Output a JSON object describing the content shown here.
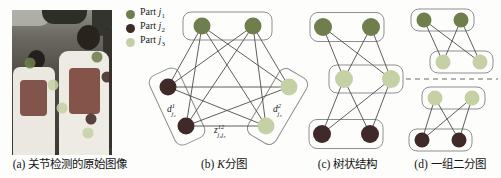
{
  "page": {
    "background": "#fdfdfc"
  },
  "parts": {
    "j1": "#6e7e4c",
    "j2": "#402a27",
    "j3": "#c6d0a5"
  },
  "style": {
    "edge_color": "#4d4d4d",
    "box_stroke": "#8f8f8f",
    "box_fill": "#fdfdfc",
    "divider_color": "#9a9a9a"
  },
  "legend": {
    "items": [
      {
        "prefix": "Part ",
        "symbol": "j",
        "subscript": "1",
        "part": "j1"
      },
      {
        "prefix": "Part ",
        "symbol": "j",
        "subscript": "2",
        "part": "j2"
      },
      {
        "prefix": "Part ",
        "symbol": "j",
        "subscript": "3",
        "part": "j3"
      }
    ]
  },
  "panels": {
    "a": {
      "caption": "(a) 关节检测的原始图像"
    },
    "b": {
      "caption_prefix": "(b) ",
      "caption_var": "K",
      "caption_suffix": "分图"
    },
    "c": {
      "caption": "(c) 树状结构"
    },
    "d": {
      "caption": "(d) 一组二分图"
    }
  },
  "photo": {
    "joints": [
      {
        "x": 18,
        "y": 53,
        "part": "j1"
      },
      {
        "x": 85,
        "y": 47,
        "part": "j1"
      },
      {
        "x": 95,
        "y": 67,
        "part": "j2"
      },
      {
        "x": 41,
        "y": 75,
        "part": "j3"
      },
      {
        "x": 50,
        "y": 98,
        "part": "j3"
      },
      {
        "x": 79,
        "y": 109,
        "part": "j2"
      },
      {
        "x": 76,
        "y": 123,
        "part": "j3"
      }
    ]
  },
  "graphs": {
    "order": [
      "b",
      "c",
      "d1",
      "d2"
    ],
    "b": {
      "name": "k-partite-graph",
      "node_r": 8.5,
      "boxes": [
        {
          "cx": 227.5,
          "cy": 26,
          "w": 89,
          "h": 28,
          "angle": 0
        },
        {
          "cx": 177,
          "cy": 106.5,
          "w": 32,
          "h": 76,
          "angle": -24.8
        },
        {
          "cx": 277.5,
          "cy": 106.5,
          "w": 32,
          "h": 76,
          "angle": 30.5
        }
      ],
      "nodes": [
        {
          "x": 202,
          "y": 26,
          "part": "j1"
        },
        {
          "x": 253,
          "y": 26,
          "part": "j1"
        },
        {
          "x": 168,
          "y": 87,
          "part": "j2"
        },
        {
          "x": 186,
          "y": 126,
          "part": "j2"
        },
        {
          "x": 289,
          "y": 87,
          "part": "j3"
        },
        {
          "x": 266,
          "y": 126,
          "part": "j3"
        }
      ],
      "edges": [
        [
          0,
          2
        ],
        [
          0,
          3
        ],
        [
          0,
          4
        ],
        [
          0,
          5
        ],
        [
          1,
          2
        ],
        [
          1,
          3
        ],
        [
          1,
          4
        ],
        [
          1,
          5
        ],
        [
          2,
          4
        ],
        [
          2,
          5
        ],
        [
          3,
          4
        ],
        [
          3,
          5
        ]
      ],
      "labels": [
        {
          "base": "d",
          "sup": "1",
          "sub": "j₂",
          "x": 167,
          "y": 112
        },
        {
          "base": "z",
          "sup": "12",
          "sub": "j₂j₃",
          "x": 214,
          "y": 133
        },
        {
          "base": "d",
          "sup": "2",
          "sub": "j₃",
          "x": 273,
          "y": 112
        }
      ]
    },
    "c": {
      "name": "tree-structure-graph",
      "node_r": 9,
      "boxes": [
        {
          "cx": 347,
          "cy": 27,
          "w": 74,
          "h": 29,
          "angle": 0
        },
        {
          "cx": 366,
          "cy": 79,
          "w": 74,
          "h": 28,
          "angle": 0
        },
        {
          "cx": 346,
          "cy": 134,
          "w": 74,
          "h": 29,
          "angle": 0
        }
      ],
      "nodes": [
        {
          "x": 323,
          "y": 27,
          "part": "j1"
        },
        {
          "x": 371,
          "y": 27,
          "part": "j1"
        },
        {
          "x": 344,
          "y": 79,
          "part": "j3"
        },
        {
          "x": 391,
          "y": 79,
          "part": "j3"
        },
        {
          "x": 322,
          "y": 134,
          "part": "j2"
        },
        {
          "x": 370,
          "y": 134,
          "part": "j2"
        }
      ],
      "edges": [
        [
          0,
          2
        ],
        [
          0,
          3
        ],
        [
          1,
          2
        ],
        [
          1,
          3
        ],
        [
          2,
          4
        ],
        [
          2,
          5
        ],
        [
          3,
          4
        ],
        [
          3,
          5
        ]
      ],
      "labels": []
    },
    "d1": {
      "name": "bipartite-graph-top",
      "node_r": 7.5,
      "boxes": [
        {
          "cx": 442.5,
          "cy": 20,
          "w": 63,
          "h": 22,
          "angle": 0
        },
        {
          "cx": 461.5,
          "cy": 62,
          "w": 63,
          "h": 22,
          "angle": 0
        }
      ],
      "nodes": [
        {
          "x": 424,
          "y": 20,
          "part": "j1"
        },
        {
          "x": 461,
          "y": 20,
          "part": "j1"
        },
        {
          "x": 443,
          "y": 62,
          "part": "j3"
        },
        {
          "x": 480,
          "y": 62,
          "part": "j3"
        }
      ],
      "edges": [
        [
          0,
          2
        ],
        [
          0,
          3
        ],
        [
          1,
          2
        ],
        [
          1,
          3
        ]
      ],
      "labels": []
    },
    "d2": {
      "name": "bipartite-graph-bottom",
      "node_r": 7.5,
      "boxes": [
        {
          "cx": 453.5,
          "cy": 98,
          "w": 63,
          "h": 22,
          "angle": 0
        },
        {
          "cx": 440.5,
          "cy": 140,
          "w": 63,
          "h": 22,
          "angle": 0
        }
      ],
      "nodes": [
        {
          "x": 435,
          "y": 98,
          "part": "j3"
        },
        {
          "x": 472,
          "y": 98,
          "part": "j3"
        },
        {
          "x": 422,
          "y": 140,
          "part": "j2"
        },
        {
          "x": 459,
          "y": 140,
          "part": "j2"
        }
      ],
      "edges": [
        [
          0,
          2
        ],
        [
          0,
          3
        ],
        [
          1,
          2
        ],
        [
          1,
          3
        ]
      ],
      "labels": []
    },
    "divider": {
      "x1": 406,
      "y1": 79,
      "x2": 498,
      "y2": 79
    }
  }
}
